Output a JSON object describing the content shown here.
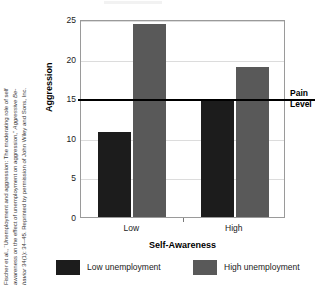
{
  "credit": {
    "line1": "Fischer et al., “Unemployment and aggression: The moderating role of self",
    "line2_pre": "awareness on the effect of unemployment on aggression,” ",
    "line2_ital": "Aggressive Be-",
    "line3_ital": "havior",
    "line3_post": " 34(1): 34–45.  Reprinted by permission of John Wiley and Sons, Inc."
  },
  "chart_data": {
    "type": "bar",
    "title": "",
    "xlabel": "Self-Awareness",
    "ylabel": "Aggression",
    "categories": [
      "Low",
      "High"
    ],
    "series": [
      {
        "name": "Low unemployment",
        "color": "#1c1c1c",
        "values": [
          10.7,
          14.9
        ]
      },
      {
        "name": "High unemployment",
        "color": "#595959",
        "values": [
          24.4,
          18.9
        ]
      }
    ],
    "ylim": [
      0,
      25
    ],
    "yticks": [
      0,
      5,
      10,
      15,
      20,
      25
    ],
    "ytick_labels": [
      "0",
      "5",
      "10",
      "15",
      "20",
      "25"
    ],
    "grid": true,
    "legend_position": "bottom",
    "annotations": [
      {
        "name": "pain-level-line",
        "label_line1": "Pain",
        "label_line2": "Level",
        "value": 15,
        "color": "#000000"
      }
    ]
  }
}
